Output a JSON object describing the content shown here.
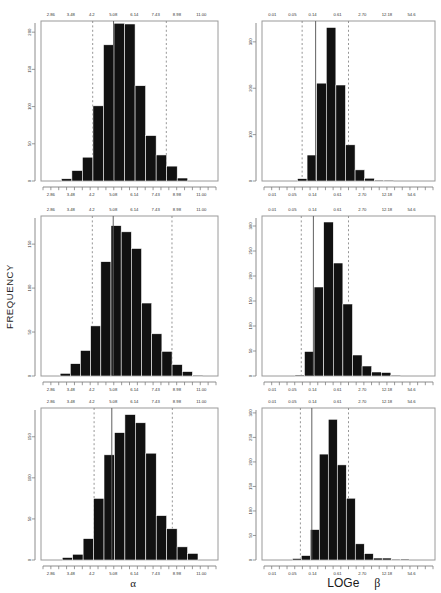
{
  "figure": {
    "ylabel": "FREQUENCY",
    "background": "#ffffff",
    "bar_color": "#111111",
    "mean_line_color": "#555555",
    "ci_line_color": "#8a8a8a"
  },
  "axis_titles": {
    "left_column": "α",
    "right_column_prefix": "LOGe",
    "right_column_symbol": "β"
  },
  "chart_data": [
    {
      "id": "panel-top-left",
      "type": "bar",
      "title": "",
      "xlabel": "α",
      "ylabel": "FREQUENCY",
      "xticklabels": [
        "2.86",
        "3.48",
        "4.2",
        "5.08",
        "6.14",
        "7.43",
        "8.98",
        "11.00"
      ],
      "xtickvalues": [
        2.86,
        3.48,
        4.2,
        5.08,
        6.14,
        7.43,
        8.98,
        11.0
      ],
      "yticklabels": [
        "0",
        "50",
        "100",
        "150",
        "200"
      ],
      "ylim": [
        0,
        215
      ],
      "grid": false,
      "legend": null,
      "x_scale": "log",
      "bin_edges": [
        3.18,
        3.48,
        3.82,
        4.2,
        4.61,
        5.08,
        5.58,
        6.14,
        6.75,
        7.43,
        8.17,
        8.98,
        9.88,
        10.87
      ],
      "values": [
        3,
        14,
        32,
        101,
        183,
        212,
        211,
        128,
        61,
        35,
        20,
        4,
        0
      ],
      "mean": 4.95,
      "ci_lower": 4.05,
      "ci_upper": 8.35
    },
    {
      "id": "panel-top-right",
      "type": "bar",
      "title": "",
      "xlabel": "LOGe β",
      "ylabel": "FREQUENCY",
      "xticklabels": [
        "0.01",
        "0.05",
        "0.14",
        "0.61",
        "2.70",
        "12.18",
        "54.6"
      ],
      "xtickvalues": [
        0.01,
        0.05,
        0.14,
        0.61,
        2.7,
        12.18,
        54.6
      ],
      "yticklabels": [
        "0",
        "100",
        "200",
        "300"
      ],
      "ylim": [
        0,
        345
      ],
      "grid": false,
      "legend": null,
      "x_scale": "log",
      "values": [
        5,
        56,
        211,
        331,
        207,
        78,
        24,
        6,
        2,
        1
      ],
      "mean": 0.175,
      "ci_lower": 0.105,
      "ci_upper": 1.35
    },
    {
      "id": "panel-middle-left",
      "type": "bar",
      "title": "",
      "xlabel": "α",
      "ylabel": "FREQUENCY",
      "xticklabels": [
        "2.86",
        "3.48",
        "4.2",
        "5.08",
        "6.14",
        "7.43",
        "8.98",
        "11.00"
      ],
      "xtickvalues": [
        2.86,
        3.48,
        4.2,
        5.08,
        6.14,
        7.43,
        8.98,
        11.0
      ],
      "yticklabels": [
        "0",
        "50",
        "100",
        "150"
      ],
      "ylim": [
        0,
        182
      ],
      "grid": false,
      "legend": null,
      "x_scale": "log",
      "values": [
        3,
        14,
        29,
        57,
        130,
        171,
        164,
        145,
        83,
        48,
        28,
        13,
        5,
        1
      ],
      "mean": 4.95,
      "ci_lower": 4.05,
      "ci_upper": 9.4
    },
    {
      "id": "panel-middle-right",
      "type": "bar",
      "title": "",
      "xlabel": "LOGe β",
      "ylabel": "FREQUENCY",
      "xticklabels": [
        "0.01",
        "0.05",
        "0.14",
        "0.61",
        "2.70",
        "12.18",
        "54.6"
      ],
      "xtickvalues": [
        0.01,
        0.05,
        0.14,
        0.61,
        2.7,
        12.18,
        54.6
      ],
      "yticklabels": [
        "0",
        "50",
        "100",
        "150",
        "200",
        "250",
        "300"
      ],
      "ylim": [
        0,
        320
      ],
      "grid": false,
      "legend": null,
      "x_scale": "log",
      "values": [
        2,
        49,
        178,
        308,
        226,
        144,
        42,
        20,
        8,
        7,
        1
      ],
      "mean": 0.165,
      "ci_lower": 0.105,
      "ci_upper": 1.05
    },
    {
      "id": "panel-bottom-left",
      "type": "bar",
      "title": "",
      "xlabel": "α",
      "ylabel": "FREQUENCY",
      "xticklabels": [
        "2.86",
        "3.48",
        "4.2",
        "5.08",
        "6.14",
        "7.43",
        "8.98",
        "11.00"
      ],
      "xtickvalues": [
        2.86,
        3.48,
        4.2,
        5.08,
        6.14,
        7.43,
        8.98,
        11.0
      ],
      "yticklabels": [
        "0",
        "50",
        "100",
        "150"
      ],
      "ylim": [
        0,
        185
      ],
      "grid": false,
      "legend": null,
      "x_scale": "log",
      "values": [
        3,
        7,
        26,
        75,
        128,
        155,
        177,
        167,
        130,
        54,
        38,
        16,
        8
      ],
      "mean": 4.88,
      "ci_lower": 4.35,
      "ci_upper": 9.4
    },
    {
      "id": "panel-bottom-right",
      "type": "bar",
      "title": "",
      "xlabel": "LOGe β",
      "ylabel": "FREQUENCY",
      "xticklabels": [
        "0.01",
        "0.05",
        "0.14",
        "0.61",
        "2.70",
        "12.18",
        "54.6"
      ],
      "xtickvalues": [
        0.01,
        0.05,
        0.14,
        0.61,
        2.7,
        12.18,
        54.6
      ],
      "yticklabels": [
        "0",
        "50",
        "100",
        "150",
        "200",
        "250",
        "300"
      ],
      "ylim": [
        0,
        310
      ],
      "grid": false,
      "legend": null,
      "x_scale": "log",
      "values": [
        3,
        9,
        62,
        216,
        287,
        194,
        126,
        33,
        13,
        4,
        4,
        1,
        2
      ],
      "mean": 0.16,
      "ci_lower": 0.105,
      "ci_upper": 1.35
    }
  ]
}
